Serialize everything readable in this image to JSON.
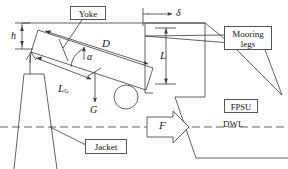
{
  "diagram": {
    "type": "engineering-schematic",
    "stroke_color": "#3b3b3b",
    "background": "#ffffff"
  },
  "callout_boxes": [
    {
      "id": "yoke",
      "label": "Yoke"
    },
    {
      "id": "mooring-legs",
      "label": "Mooring\nlegs",
      "line1": "Mooring",
      "line2": "legs"
    },
    {
      "id": "fpsu",
      "label": "FPSU"
    },
    {
      "id": "jacket",
      "label": "Jacket"
    },
    {
      "id": "force-arrow",
      "label": "F"
    }
  ],
  "dimension_labels": [
    {
      "id": "h",
      "label": "h",
      "meaning": "vertical offset height"
    },
    {
      "id": "delta",
      "label": "δ",
      "meaning": "horizontal offset"
    },
    {
      "id": "D",
      "label": "D",
      "meaning": "yoke length dimension"
    },
    {
      "id": "L",
      "label": "L",
      "meaning": "vertical length dimension"
    },
    {
      "id": "alpha",
      "label": "α",
      "meaning": "inclination angle"
    },
    {
      "id": "LG",
      "label": "L",
      "sub": "G",
      "meaning": "distance to centre of gravity"
    },
    {
      "id": "G",
      "label": "G",
      "meaning": "gravity force of yoke"
    },
    {
      "id": "F",
      "label": "F",
      "meaning": "environmental force"
    },
    {
      "id": "DWL",
      "label": "DWL",
      "meaning": "design water line"
    }
  ],
  "annotations": {
    "waterline_style": "dashed",
    "waterline_label": "DWL"
  }
}
